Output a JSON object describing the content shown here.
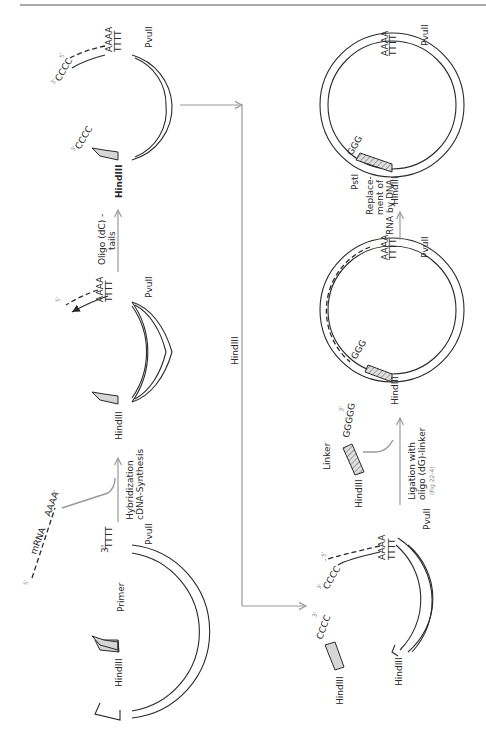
{
  "figure": {
    "orientation": "rotated-90-ccw",
    "colors": {
      "ink": "#2a2a2a",
      "arrow": "#9a9a9a",
      "insert_fill": "#d6d6d6",
      "background": "#ffffff"
    },
    "steps": {
      "step1": {
        "mrna_label": "mRNA",
        "mrna_5prime": "5'",
        "mrna_3prime_tail": "AAAA",
        "mrna_3prime": "3'",
        "primer_label": "Primer",
        "site_left": "HindIII",
        "site_right": "PvuII",
        "poly_t": "TTTT",
        "poly_t_end": "3'"
      },
      "arrow1": {
        "label_line1": "Hybridization",
        "label_line2": "cDNA-Synthesis"
      },
      "step2": {
        "site_left": "HindIII",
        "site_right": "PvuII",
        "poly_a": "AAAA",
        "poly_t": "TTTT",
        "five_prime": "5'"
      },
      "arrow2": {
        "label_line1": "Oligo (dC) -",
        "label_line2": "tails"
      },
      "step3": {
        "site_left": "HindIII",
        "site_right": "PvuII",
        "poly_a": "AAAA",
        "poly_t": "TTTT",
        "tail_top": "CCCC",
        "tail_top_end": "3'",
        "tail_bottom": "CCCC",
        "tail_bottom_end": "3'",
        "five_prime": "5'"
      },
      "arrow3": {
        "label": "HindIII"
      },
      "step4": {
        "fragment_site": "HindIII",
        "fragment_tail": "CCCC",
        "fragment_tail_end": "3'",
        "vector_site": "HindIII",
        "site_right": "PvuII",
        "poly_a": "AAAA",
        "poly_t": "TTTT",
        "five_prime": "5'",
        "tail_end": "3'"
      },
      "arrow4": {
        "label_line1": "Ligation with",
        "label_line2": "oligo (dG)-linker",
        "note": "(Fig 22-4)",
        "linker_label": "Linker",
        "linker_site": "HindIII",
        "linker_seq": "GGGGG",
        "linker_end": "3'"
      },
      "step5": {
        "site_left": "HindIII",
        "site_right": "PvuII",
        "poly_a": "AAAA",
        "poly_t": "TTTT",
        "g_tail": "GGG",
        "c_tail": "CCC"
      },
      "arrow5": {
        "label_line1": "Replace-",
        "label_line2": "ment of",
        "label_line3": "RNA by DNA"
      },
      "step6": {
        "site_left": "HindIII",
        "site_pst": "PstI",
        "site_right": "PvuII",
        "poly_a": "AAAA",
        "poly_t": "TTTT",
        "g_tail": "GGG",
        "c_tail": "CCC"
      }
    }
  }
}
